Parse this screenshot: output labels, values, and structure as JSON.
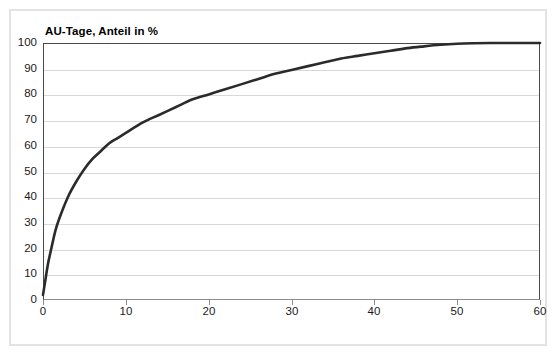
{
  "figure": {
    "background_color": "#ffffff",
    "frame_color": "#e3e3e3",
    "axis_color": "#4a4a4a",
    "grid_color": "#d8d8d8",
    "curve_color": "#2b2b2b"
  },
  "chart_data": {
    "type": "line",
    "title": "",
    "subtitle": "",
    "xlabel": "AOK-Mitglieder, Anteil in %",
    "ylabel": "AU-Tage, Anteil in %",
    "xlim": [
      0,
      60
    ],
    "ylim": [
      0,
      100
    ],
    "xticks": [
      0,
      10,
      20,
      30,
      40,
      50,
      60
    ],
    "yticks": [
      0,
      10,
      20,
      30,
      40,
      50,
      60,
      70,
      80,
      90,
      100
    ],
    "xtick_labels": [
      "0",
      "10",
      "20",
      "30",
      "40",
      "50",
      "60"
    ],
    "ytick_labels": [
      "0",
      "10",
      "20",
      "30",
      "40",
      "50",
      "60",
      "70",
      "80",
      "90",
      "100"
    ],
    "grid": "horizontal",
    "legend": "none",
    "annotations": [],
    "series": [
      {
        "name": "Konzentrationskurve AU-Tage",
        "x": [
          0,
          0.3,
          0.6,
          1,
          1.5,
          2,
          3,
          4,
          5,
          6,
          7,
          8,
          9,
          10,
          12,
          14,
          16,
          18,
          20,
          22,
          24,
          26,
          28,
          30,
          32,
          34,
          36,
          38,
          40,
          42,
          44,
          46,
          48,
          50,
          52,
          54,
          56,
          58,
          60
        ],
        "y": [
          2,
          8,
          14,
          20,
          27,
          32,
          40,
          46,
          51,
          55,
          58,
          61,
          63,
          65,
          69,
          72,
          75,
          78,
          80,
          82,
          84,
          86,
          88,
          89.5,
          91,
          92.5,
          94,
          95,
          96,
          97,
          98,
          98.7,
          99.3,
          99.7,
          99.9,
          100,
          100,
          100,
          100
        ]
      }
    ]
  }
}
